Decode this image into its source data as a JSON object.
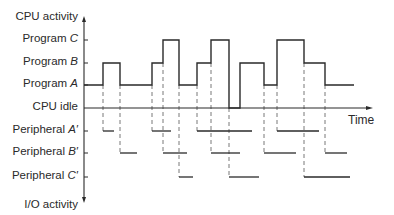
{
  "diagram": {
    "y_axis_top_label": "CPU activity",
    "y_axis_bottom_label": "I/O activity",
    "x_axis_label": "Time",
    "cpu_levels": [
      {
        "id": "C",
        "prefix": "Program ",
        "letter": "C",
        "y": 40
      },
      {
        "id": "B",
        "prefix": "Program ",
        "letter": "B",
        "y": 63
      },
      {
        "id": "A",
        "prefix": "Program ",
        "letter": "A",
        "y": 85
      },
      {
        "id": "idle",
        "prefix": "CPU idle",
        "letter": "",
        "y": 108
      }
    ],
    "io_levels": [
      {
        "id": "A'",
        "prefix": "Peripheral ",
        "letter": "A′",
        "y": 131
      },
      {
        "id": "B'",
        "prefix": "Peripheral ",
        "letter": "B′",
        "y": 153
      },
      {
        "id": "C'",
        "prefix": "Peripheral ",
        "letter": "C′",
        "y": 177
      }
    ],
    "cpu_timeline": [
      {
        "state": "A",
        "x0": 84,
        "x1": 103
      },
      {
        "state": "B",
        "x0": 103,
        "x1": 120
      },
      {
        "state": "A",
        "x0": 120,
        "x1": 152
      },
      {
        "state": "B",
        "x0": 152,
        "x1": 163
      },
      {
        "state": "C",
        "x0": 163,
        "x1": 179
      },
      {
        "state": "A",
        "x0": 179,
        "x1": 197
      },
      {
        "state": "B",
        "x0": 197,
        "x1": 211
      },
      {
        "state": "C",
        "x0": 211,
        "x1": 229
      },
      {
        "state": "idle",
        "x0": 229,
        "x1": 240
      },
      {
        "state": "B",
        "x0": 240,
        "x1": 264
      },
      {
        "state": "A",
        "x0": 264,
        "x1": 277
      },
      {
        "state": "C",
        "x0": 277,
        "x1": 304
      },
      {
        "state": "B",
        "x0": 304,
        "x1": 325
      },
      {
        "state": "A",
        "x0": 325,
        "x1": 354
      }
    ],
    "io_segments": [
      {
        "device": "A'",
        "x0": 103,
        "x1": 114
      },
      {
        "device": "A'",
        "x0": 152,
        "x1": 171
      },
      {
        "device": "A'",
        "x0": 197,
        "x1": 252
      },
      {
        "device": "A'",
        "x0": 277,
        "x1": 319
      },
      {
        "device": "B'",
        "x0": 120,
        "x1": 137
      },
      {
        "device": "B'",
        "x0": 163,
        "x1": 187
      },
      {
        "device": "B'",
        "x0": 211,
        "x1": 240
      },
      {
        "device": "B'",
        "x0": 264,
        "x1": 296
      },
      {
        "device": "B'",
        "x0": 325,
        "x1": 347
      },
      {
        "device": "C'",
        "x0": 179,
        "x1": 193
      },
      {
        "device": "C'",
        "x0": 229,
        "x1": 259
      },
      {
        "device": "C'",
        "x0": 304,
        "x1": 350
      }
    ],
    "colors": {
      "line": "#2a2a2a",
      "dashed": "#555555",
      "background": "#ffffff"
    }
  }
}
